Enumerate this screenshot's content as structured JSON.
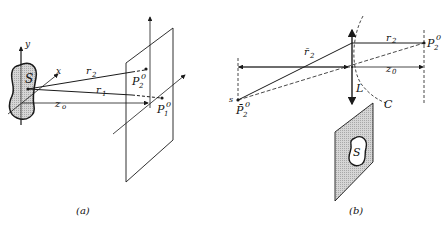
{
  "diagram": {
    "panel_a": {
      "caption": "(a)",
      "labels": {
        "source": "S",
        "y_axis": "y",
        "x_axis": "x",
        "r2": "r",
        "r2_sub": "2",
        "r1": "r",
        "r1_sub": "1",
        "z0": "z",
        "z0_sub": "o",
        "p2": "P",
        "p2_sub": "2",
        "p2_sup": "0",
        "p1": "P",
        "p1_sub": "1",
        "p1_sup": "0"
      }
    },
    "panel_b": {
      "caption": "(b)",
      "labels": {
        "r2bar": "r̄",
        "r2bar_sub": "2",
        "r2": "r",
        "r2_sub": "2",
        "p2": "P",
        "p2_sub": "2",
        "p2_sup": "0",
        "z0": "z",
        "z0_sub": "0",
        "lens": "L",
        "curve": "C",
        "s_point": "s",
        "p2bar": "P̄",
        "p2bar_sub": "2",
        "p2bar_sup": "0",
        "source": "S"
      }
    },
    "colors": {
      "line": "#1a1a1a",
      "shade": "#c8c8c8"
    }
  }
}
